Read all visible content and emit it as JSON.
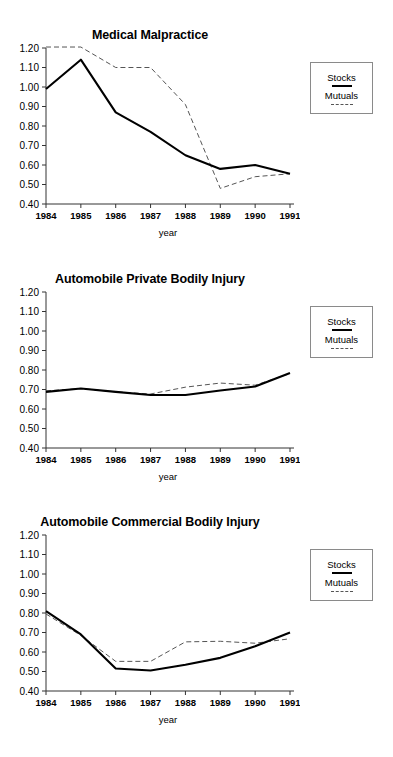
{
  "page": {
    "background": "#ffffff",
    "width": 393,
    "height": 757
  },
  "legend": {
    "series1_label": "Stocks",
    "series2_label": "Mutuals",
    "series1_style": "solid",
    "series2_style": "dashed",
    "series1_color": "#000000",
    "series2_color": "#555555"
  },
  "axis": {
    "x_title": "year",
    "y_ticks": [
      "1.20",
      "1.10",
      "1.00",
      "0.90",
      "0.80",
      "0.70",
      "0.60",
      "0.50",
      "0.40"
    ],
    "x_ticks": [
      "1984",
      "1985",
      "1986",
      "1987",
      "1988",
      "1989",
      "1990",
      "1991"
    ]
  },
  "chart_data": [
    {
      "type": "line",
      "title": "Medical Malpractice",
      "xlabel": "year",
      "ylabel": "",
      "x": [
        "1984",
        "1985",
        "1986",
        "1987",
        "1988",
        "1989",
        "1990",
        "1991"
      ],
      "ylim": [
        0.4,
        1.2
      ],
      "yticks": [
        0.4,
        0.5,
        0.6,
        0.7,
        0.8,
        0.9,
        1.0,
        1.1,
        1.2
      ],
      "grid": false,
      "legend_position": "right-outside",
      "series": [
        {
          "name": "Stocks",
          "style": "solid",
          "values": [
            0.99,
            1.14,
            0.87,
            0.77,
            0.65,
            0.58,
            0.6,
            0.555
          ]
        },
        {
          "name": "Mutuals",
          "style": "dashed",
          "values": [
            1.205,
            1.205,
            1.1,
            1.1,
            0.91,
            0.48,
            0.54,
            0.555
          ]
        }
      ]
    },
    {
      "type": "line",
      "title": "Automobile Private Bodily Injury",
      "xlabel": "year",
      "ylabel": "",
      "x": [
        "1984",
        "1985",
        "1986",
        "1987",
        "1988",
        "1989",
        "1990",
        "1991"
      ],
      "ylim": [
        0.4,
        1.2
      ],
      "yticks": [
        0.4,
        0.5,
        0.6,
        0.7,
        0.8,
        0.9,
        1.0,
        1.1,
        1.2
      ],
      "grid": false,
      "legend_position": "right-outside",
      "series": [
        {
          "name": "Stocks",
          "style": "solid",
          "values": [
            0.688,
            0.705,
            0.688,
            0.672,
            0.672,
            0.695,
            0.715,
            0.785
          ]
        },
        {
          "name": "Mutuals",
          "style": "dashed",
          "values": [
            0.693,
            0.705,
            0.688,
            0.677,
            0.712,
            0.733,
            0.722,
            0.782
          ]
        }
      ]
    },
    {
      "type": "line",
      "title": "Automobile Commercial Bodily Injury",
      "xlabel": "year",
      "ylabel": "",
      "x": [
        "1984",
        "1985",
        "1986",
        "1987",
        "1988",
        "1989",
        "1990",
        "1991"
      ],
      "ylim": [
        0.4,
        1.2
      ],
      "yticks": [
        0.4,
        0.5,
        0.6,
        0.7,
        0.8,
        0.9,
        1.0,
        1.1,
        1.2
      ],
      "grid": false,
      "legend_position": "right-outside",
      "series": [
        {
          "name": "Stocks",
          "style": "solid",
          "values": [
            0.81,
            0.69,
            0.515,
            0.505,
            0.535,
            0.57,
            0.63,
            0.7
          ]
        },
        {
          "name": "Mutuals",
          "style": "dashed",
          "values": [
            0.795,
            0.685,
            0.552,
            0.552,
            0.652,
            0.655,
            0.645,
            0.668
          ]
        }
      ]
    }
  ]
}
